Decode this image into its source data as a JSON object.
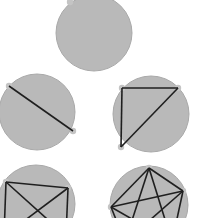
{
  "diagram": {
    "title": "",
    "colors": {
      "background": "#ffffff",
      "circle_fill": "#b9b9b9",
      "circle_stroke": "#a9a9a9",
      "vertex_fill": "#c4c4c4",
      "chord_stroke": "#1f1f1f"
    },
    "circles": [
      {
        "id": "circle-1-point",
        "cx": 94,
        "cy": 33,
        "r": 38,
        "vertices": [
          [
            70,
            2
          ]
        ],
        "chords": []
      },
      {
        "id": "circle-2-points",
        "cx": 37,
        "cy": 112,
        "r": 38,
        "vertices": [
          [
            9,
            86
          ],
          [
            73,
            131
          ]
        ],
        "chords": [
          [
            0,
            1
          ]
        ]
      },
      {
        "id": "circle-3-points",
        "cx": 151,
        "cy": 114,
        "r": 38,
        "vertices": [
          [
            122,
            88
          ],
          [
            178,
            88
          ],
          [
            121,
            147
          ]
        ],
        "chords": [
          [
            0,
            1
          ],
          [
            1,
            2
          ],
          [
            0,
            2
          ]
        ]
      },
      {
        "id": "circle-4-points",
        "cx": 36,
        "cy": 204,
        "r": 39,
        "vertices": [
          [
            6,
            182
          ],
          [
            68,
            188
          ],
          [
            66,
            236
          ],
          [
            4,
            236
          ]
        ],
        "chords": [
          [
            0,
            1
          ],
          [
            1,
            2
          ],
          [
            2,
            3
          ],
          [
            3,
            0
          ],
          [
            0,
            2
          ],
          [
            1,
            3
          ]
        ]
      },
      {
        "id": "circle-5-points",
        "cx": 149,
        "cy": 205,
        "r": 39,
        "vertices": [
          [
            149,
            168
          ],
          [
            183,
            191
          ],
          [
            172,
            242
          ],
          [
            125,
            242
          ],
          [
            111,
            207
          ]
        ],
        "chords": [
          [
            0,
            1
          ],
          [
            1,
            2
          ],
          [
            2,
            3
          ],
          [
            3,
            4
          ],
          [
            4,
            0
          ],
          [
            0,
            2
          ],
          [
            0,
            3
          ],
          [
            1,
            3
          ],
          [
            1,
            4
          ],
          [
            2,
            4
          ]
        ]
      }
    ]
  }
}
